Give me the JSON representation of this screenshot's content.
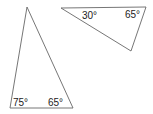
{
  "diagram": {
    "triangles": [
      {
        "name": "triangle-1",
        "angles": [
          {
            "label": "75°",
            "vertex": "bottom-left"
          },
          {
            "label": "65°",
            "vertex": "bottom-right"
          }
        ]
      },
      {
        "name": "triangle-2",
        "angles": [
          {
            "label": "30°",
            "vertex": "left"
          },
          {
            "label": "65°",
            "vertex": "right"
          }
        ]
      }
    ],
    "stroke_color": "#555555"
  }
}
